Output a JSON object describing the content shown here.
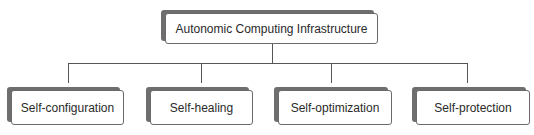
{
  "diagram": {
    "type": "hierarchy",
    "root": {
      "label": "Autonomic Computing Infrastructure",
      "box": {
        "x": 165,
        "y": 13,
        "w": 213,
        "h": 31
      }
    },
    "connector": {
      "trunk": {
        "x": 272,
        "y1": 44,
        "y2": 63
      },
      "bus": {
        "y": 63,
        "x1": 68,
        "x2": 467
      },
      "drops_y2": 83
    },
    "children": [
      {
        "label": "Self-configuration",
        "drop_x": 68,
        "box": {
          "x": 11,
          "y": 90,
          "w": 113,
          "h": 35
        }
      },
      {
        "label": "Self-healing",
        "drop_x": 201,
        "box": {
          "x": 150,
          "y": 90,
          "w": 103,
          "h": 35
        }
      },
      {
        "label": "Self-optimization",
        "drop_x": 331,
        "box": {
          "x": 278,
          "y": 90,
          "w": 114,
          "h": 35
        }
      },
      {
        "label": "Self-protection",
        "drop_x": 467,
        "box": {
          "x": 416,
          "y": 90,
          "w": 114,
          "h": 35
        }
      }
    ],
    "colors": {
      "box_border": "#6a6a6a",
      "shadow": "#6e6e6e",
      "line": "#555555",
      "text": "#2a2a2a"
    }
  }
}
